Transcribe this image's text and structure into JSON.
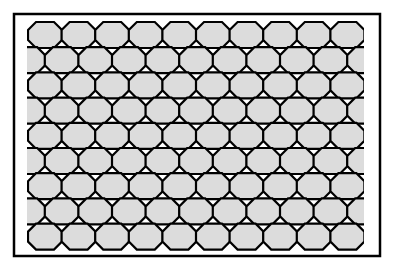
{
  "figure": {
    "frame": {
      "x": 14,
      "y": 14,
      "width": 366,
      "height": 242,
      "stroke": "#000000",
      "stroke_width": 2.5,
      "fill": "#ffffff"
    },
    "pattern": {
      "shape": "octagon",
      "rows": 9,
      "full_row_columns": 10,
      "offset_row_columns": 9,
      "offset_rows_have_partial_edge_cells": true,
      "origin_x": 28,
      "origin_y": 22,
      "cell_width": 34,
      "cell_height": 26,
      "column_pitch": 33.6,
      "row_pitch": 25.2,
      "corner_cut": 8,
      "fill_color": "#dcdcdc",
      "stroke_color": "#000000",
      "stroke_width": 2.2,
      "clip_left": 27,
      "clip_right": 364
    }
  }
}
